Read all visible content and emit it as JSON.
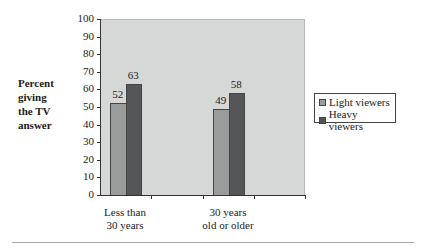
{
  "chart_data": {
    "type": "bar",
    "title": "",
    "xlabel": "",
    "ylabel": "Percent giving the TV answer",
    "ylim": [
      0,
      100
    ],
    "yticks": [
      0,
      10,
      20,
      30,
      40,
      50,
      60,
      70,
      80,
      90,
      100
    ],
    "categories": [
      "Less than 30 years",
      "30 years old or older"
    ],
    "series": [
      {
        "name": "Light viewers",
        "values": [
          52,
          49
        ],
        "color": "#9a9c9c"
      },
      {
        "name": "Heavy viewers",
        "values": [
          63,
          58
        ],
        "color": "#555657"
      }
    ],
    "legend_position": "right",
    "grid": false
  },
  "ylabel_lines": [
    "Percent",
    "giving",
    "the TV",
    "answer"
  ],
  "category_lines": [
    [
      "Less than",
      "30 years"
    ],
    [
      "30 years",
      "old or older"
    ]
  ]
}
